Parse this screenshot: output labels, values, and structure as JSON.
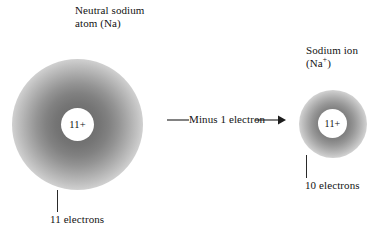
{
  "figure": {
    "background_color": "#ffffff",
    "ink_color": "#131313",
    "cloud_color": "#6a6a6a"
  },
  "left_atom": {
    "caption_line1": "Neutral sodium",
    "caption_line2": "atom (Na)",
    "nucleus_charge": "11+",
    "electron_count_label": "11 electrons",
    "cloud_radius_px": 65,
    "nucleus_radius_px": 16
  },
  "right_atom": {
    "caption_line1": "Sodium ion",
    "caption_line2_prefix": "(Na",
    "caption_line2_sup": "+",
    "caption_line2_suffix": ")",
    "nucleus_charge": "11+",
    "electron_count_label": "10 electrons",
    "cloud_radius_px": 34,
    "nucleus_radius_px": 14
  },
  "arrow": {
    "label": "Minus 1 electron",
    "direction": "right"
  }
}
